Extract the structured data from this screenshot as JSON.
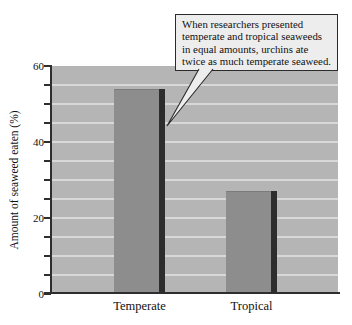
{
  "callout": {
    "lines": [
      "When researchers presented",
      "temperate and tropical seaweeds",
      "in equal amounts, urchins ate",
      "twice as much temperate seaweed."
    ],
    "text": "When researchers presented temperate and tropical seaweeds in equal amounts, urchins ate twice as much temperate seaweed."
  },
  "chart_data": {
    "type": "bar",
    "categories": [
      "Temperate",
      "Tropical"
    ],
    "values": [
      54,
      27
    ],
    "title": "",
    "xlabel": "",
    "ylabel": "Amount of seaweed eaten (%)",
    "ylim": [
      0,
      60
    ],
    "ytick_labels": [
      "0",
      "20",
      "40",
      "60"
    ],
    "minor_tick_step": 5,
    "gridline_step": 5,
    "grid": true,
    "legend": "none",
    "annotation": "When researchers presented temperate and tropical seaweeds in equal amounts, urchins ate twice as much temperate seaweed.",
    "colors": {
      "plot_background": "#b5b5b5",
      "gridline": "#d8d8d8",
      "bar_fill": "#8d8d8d",
      "bar_shadow": "#2d2d2d",
      "axis": "#2e2e2e",
      "callout_background": "#ededed",
      "callout_border": "#2b2b2b"
    }
  }
}
